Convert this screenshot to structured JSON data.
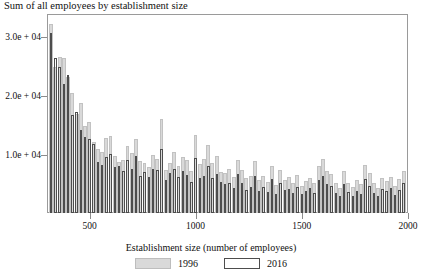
{
  "chart_data": {
    "type": "bar",
    "title": "Sum of all employees by establishment size",
    "xlabel": "Establishment size (number of employees)",
    "ylabel": "",
    "xlim": [
      300,
      2000
    ],
    "ylim": [
      0,
      34000
    ],
    "grid": false,
    "legend_position": "bottom",
    "xticks": [
      500,
      1000,
      1500,
      2000
    ],
    "xtick_labels": [
      "500",
      "1000",
      "1500",
      "2000"
    ],
    "yticks": [
      10000,
      20000,
      30000
    ],
    "ytick_labels": [
      "1.0e + 04",
      "2.0e + 04",
      "3.0e + 04"
    ],
    "colors": {
      "series_1996": "#d9d9d9",
      "series_2016_outline": "#4d4d4d",
      "axis": "#9a9a9a"
    },
    "x": [
      320,
      340,
      360,
      380,
      400,
      420,
      440,
      460,
      480,
      500,
      520,
      540,
      560,
      580,
      600,
      620,
      640,
      660,
      680,
      700,
      720,
      740,
      760,
      780,
      800,
      820,
      840,
      860,
      880,
      900,
      920,
      940,
      960,
      980,
      1000,
      1020,
      1040,
      1060,
      1080,
      1100,
      1120,
      1140,
      1160,
      1180,
      1200,
      1220,
      1240,
      1260,
      1280,
      1300,
      1320,
      1340,
      1360,
      1380,
      1400,
      1420,
      1440,
      1460,
      1480,
      1500,
      1520,
      1540,
      1560,
      1580,
      1600,
      1620,
      1640,
      1660,
      1680,
      1700,
      1720,
      1740,
      1760,
      1780,
      1800,
      1820,
      1840,
      1860,
      1880,
      1900,
      1920,
      1940,
      1960,
      1980
    ],
    "series": [
      {
        "name": "1996",
        "values": [
          32300,
          25000,
          26700,
          26500,
          23300,
          20500,
          17000,
          18800,
          14900,
          15500,
          12200,
          11000,
          10500,
          12800,
          13100,
          9800,
          8800,
          9000,
          11500,
          10200,
          12600,
          8900,
          8500,
          7800,
          9900,
          9200,
          16100,
          7400,
          8600,
          10500,
          8100,
          9600,
          9000,
          7200,
          13400,
          8400,
          9200,
          11600,
          8600,
          9700,
          7000,
          6800,
          7600,
          6200,
          9100,
          7300,
          5900,
          6300,
          8900,
          5600,
          6400,
          5300,
          8100,
          4800,
          7400,
          5600,
          6100,
          5200,
          6500,
          4700,
          5400,
          6000,
          5100,
          8000,
          9300,
          7200,
          6700,
          5200,
          4300,
          7100,
          5200,
          4400,
          5600,
          4900,
          8200,
          6800,
          5100,
          4300,
          5900,
          5400,
          6200,
          4600,
          5800,
          7100
        ]
      },
      {
        "name": "2016",
        "values": [
          30800,
          26400,
          24900,
          22000,
          23500,
          16800,
          17200,
          14100,
          13000,
          12600,
          11800,
          8800,
          8200,
          9600,
          10100,
          7900,
          8000,
          7100,
          9000,
          7600,
          9800,
          6400,
          7000,
          6100,
          7600,
          7300,
          10900,
          5600,
          6800,
          7500,
          6200,
          7200,
          6500,
          5300,
          9400,
          6000,
          6400,
          8100,
          5900,
          6700,
          5300,
          4900,
          5200,
          4300,
          6700,
          5100,
          3900,
          4400,
          6400,
          3800,
          4500,
          3600,
          5800,
          3300,
          5100,
          3900,
          4100,
          3400,
          4400,
          3200,
          3800,
          4200,
          3400,
          5700,
          6300,
          5000,
          4600,
          3500,
          2900,
          5000,
          3600,
          2900,
          3800,
          3300,
          5800,
          4700,
          3400,
          2900,
          4100,
          3700,
          4300,
          3100,
          3900,
          5100
        ]
      }
    ]
  },
  "legend": {
    "item_1996": "1996",
    "item_2016": "2016"
  }
}
